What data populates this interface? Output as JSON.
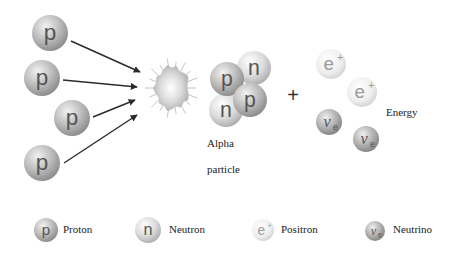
{
  "diagram": {
    "reactants": {
      "protons": [
        {
          "symbol": "p",
          "cx": 50,
          "cy": 33,
          "r": 18
        },
        {
          "symbol": "p",
          "cx": 42,
          "cy": 78,
          "r": 18
        },
        {
          "symbol": "p",
          "cx": 72,
          "cy": 118,
          "r": 18
        },
        {
          "symbol": "p",
          "cx": 42,
          "cy": 163,
          "r": 18
        }
      ]
    },
    "arrows": [
      {
        "x1": 71,
        "y1": 41,
        "x2": 140,
        "y2": 72
      },
      {
        "x1": 63,
        "y1": 80,
        "x2": 137,
        "y2": 87
      },
      {
        "x1": 93,
        "y1": 117,
        "x2": 135,
        "y2": 100
      },
      {
        "x1": 64,
        "y1": 163,
        "x2": 137,
        "y2": 115
      }
    ],
    "fusion_burst": {
      "cx": 172,
      "cy": 88
    },
    "alpha_particle": {
      "label_line1": "Alpha",
      "label_line2": "particle",
      "nucleons": [
        {
          "symbol": "n",
          "cx": 226,
          "cy": 110,
          "r": 17,
          "kind": "neutron"
        },
        {
          "symbol": "n",
          "cx": 254,
          "cy": 68,
          "r": 17,
          "kind": "neutron"
        },
        {
          "symbol": "p",
          "cx": 227,
          "cy": 79,
          "r": 17,
          "kind": "proton"
        },
        {
          "symbol": "p",
          "cx": 250,
          "cy": 100,
          "r": 17,
          "kind": "proton"
        }
      ]
    },
    "plus_sign": "+",
    "products": {
      "positrons": [
        {
          "symbol": "e",
          "sup": "+",
          "cx": 331,
          "cy": 64,
          "r": 15
        },
        {
          "symbol": "e",
          "sup": "+",
          "cx": 362,
          "cy": 92,
          "r": 15
        }
      ],
      "neutrinos": [
        {
          "symbol": "ν",
          "sub": "e",
          "cx": 329,
          "cy": 122,
          "r": 13
        },
        {
          "symbol": "ν",
          "sub": "e",
          "cx": 366,
          "cy": 139,
          "r": 13
        }
      ],
      "energy_label": "Energy"
    }
  },
  "legend": {
    "items": [
      {
        "name": "Proton",
        "symbol": "p",
        "kind": "proton"
      },
      {
        "name": "Neutron",
        "symbol": "n",
        "kind": "neutron"
      },
      {
        "name": "Positron",
        "symbol": "e",
        "sup": "+",
        "kind": "positron"
      },
      {
        "name": "Neutrino",
        "symbol": "ν",
        "sub": "e",
        "kind": "neutrino"
      }
    ]
  },
  "colors": {
    "proton_dark": "#9a9a9a",
    "proton_light": "#e6e6e6",
    "neutron_dark": "#b8b8b8",
    "neutron_light": "#f4f4f4",
    "positron_dark": "#d6d6d6",
    "positron_light": "#fbfbfb",
    "neutrino_dark": "#8f8f8f",
    "neutrino_light": "#e2e2e2",
    "arrow": "#2a2a2a",
    "text": "#222222",
    "glyph": "#555555"
  }
}
